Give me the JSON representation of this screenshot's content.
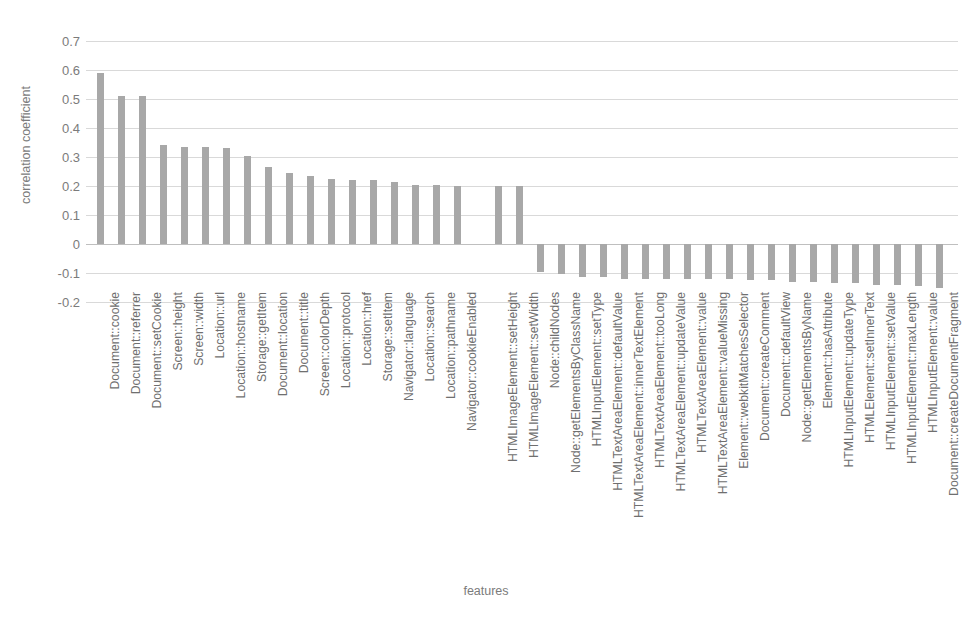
{
  "chart_data": {
    "type": "bar",
    "title": "",
    "xlabel": "features",
    "ylabel": "correlation coefficient",
    "ylim": [
      -0.2,
      0.7
    ],
    "ytick_labels": [
      "0.7",
      "0.6",
      "0.5",
      "0.4",
      "0.3",
      "0.2",
      "0.1",
      "0",
      "-0.1",
      "-0.2"
    ],
    "ytick_values": [
      0.7,
      0.6,
      0.5,
      0.4,
      0.3,
      0.2,
      0.1,
      0,
      -0.1,
      -0.2
    ],
    "grid": true,
    "legend": false,
    "bar_color": "#a8a8a8",
    "gridline_color": "#d9d9d9",
    "axis_text_color": "#7b7b7b",
    "gap_after_index": 17,
    "categories": [
      "Document::cookie",
      "Document::referrer",
      "Document::setCookie",
      "Screen::height",
      "Screen::width",
      "Location::url",
      "Location::hostname",
      "Storage::getItem",
      "Document::location",
      "Document::title",
      "Screen::colorDepth",
      "Location::protocol",
      "Location::href",
      "Storage::setItem",
      "Navigator::language",
      "Location::search",
      "Location::pathname",
      "Navigator::cookieEnabled",
      "HTMLImageElement::setHeight",
      "HTMLImageElement::setWidth",
      "Node::childNodes",
      "Node::getElementsByClassName",
      "HTMLInputElement::setType",
      "HTMLTextAreaElement::defaultValue",
      "HTMLTextAreaElement::innerTextElement",
      "HTMLTextAreaElement::tooLong",
      "HTMLTextAreaElement::updateValue",
      "HTMLTextAreaElement::value",
      "HTMLTextAreaElement::valueMissing",
      "Element::webkitMatchesSelector",
      "Document::createComment",
      "Document::defaultView",
      "Node::getElementsByName",
      "Element::hasAttribute",
      "HTMLInputElement::updateType",
      "HTMLElement::setInnerText",
      "HTMLInputElement::setValue",
      "HTMLInputElement::maxLength",
      "HTMLInputElement::value",
      "Document::createDocumentFragment"
    ],
    "values": [
      0.59,
      0.51,
      0.51,
      0.34,
      0.335,
      0.335,
      0.33,
      0.305,
      0.265,
      0.245,
      0.235,
      0.225,
      0.22,
      0.22,
      0.215,
      0.205,
      0.205,
      0.2,
      0.2,
      0.2,
      -0.095,
      -0.105,
      -0.115,
      -0.115,
      -0.12,
      -0.12,
      -0.12,
      -0.12,
      -0.12,
      -0.12,
      -0.125,
      -0.125,
      -0.13,
      -0.13,
      -0.135,
      -0.135,
      -0.14,
      -0.14,
      -0.145,
      -0.15
    ]
  }
}
